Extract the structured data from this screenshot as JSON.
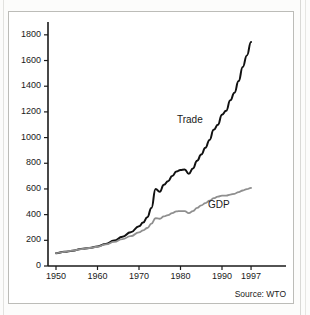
{
  "figure": {
    "clipped_caption_above": "",
    "source_note": "Source: WTO"
  },
  "chart_data": {
    "type": "line",
    "title": "",
    "subtitle": "",
    "xlabel": "",
    "ylabel": "",
    "xlim": [
      1950,
      1999
    ],
    "ylim": [
      0,
      1900
    ],
    "yticks": [
      0,
      200,
      400,
      600,
      800,
      1000,
      1200,
      1400,
      1600,
      1800
    ],
    "ytick_labels": [
      "0",
      "200",
      "400",
      "600",
      "800",
      "1000",
      "1200",
      "1400",
      "1600",
      "1800"
    ],
    "xticks": [
      1950,
      1960,
      1970,
      1980,
      1990,
      1997
    ],
    "xtick_labels": [
      "1950",
      "1960",
      "1970",
      "1980",
      "1990",
      "1997"
    ],
    "grid": false,
    "legend": "inline-annotation",
    "annotations": [
      {
        "text": "Trade",
        "x": 1983.0,
        "y": 1130
      },
      {
        "text": "GDP",
        "x": 1990.5,
        "y": 470
      }
    ],
    "series": [
      {
        "name": "Trade",
        "color": "#111111",
        "width": 2.0,
        "x": [
          1950,
          1952,
          1954,
          1956,
          1958,
          1960,
          1962,
          1964,
          1966,
          1968,
          1970,
          1971,
          1972,
          1973,
          1974,
          1975,
          1976,
          1977,
          1978,
          1979,
          1980,
          1981,
          1982,
          1983,
          1984,
          1985,
          1986,
          1987,
          1988,
          1989,
          1990,
          1991,
          1992,
          1993,
          1994,
          1995,
          1996,
          1997
        ],
        "y": [
          100,
          110,
          118,
          132,
          140,
          152,
          172,
          198,
          228,
          262,
          310,
          338,
          380,
          452,
          600,
          578,
          632,
          660,
          700,
          735,
          748,
          752,
          718,
          760,
          820,
          868,
          920,
          982,
          1060,
          1100,
          1178,
          1208,
          1290,
          1350,
          1440,
          1550,
          1640,
          1745
        ]
      },
      {
        "name": "GDP",
        "color": "#8f8f8f",
        "width": 1.8,
        "x": [
          1950,
          1952,
          1954,
          1956,
          1958,
          1960,
          1962,
          1964,
          1966,
          1968,
          1970,
          1971,
          1972,
          1973,
          1974,
          1975,
          1976,
          1977,
          1978,
          1979,
          1980,
          1981,
          1982,
          1983,
          1984,
          1985,
          1986,
          1987,
          1988,
          1989,
          1990,
          1991,
          1992,
          1993,
          1994,
          1995,
          1996,
          1997
        ],
        "y": [
          100,
          110,
          120,
          132,
          140,
          150,
          168,
          188,
          210,
          232,
          262,
          278,
          296,
          330,
          372,
          368,
          386,
          396,
          412,
          425,
          428,
          428,
          412,
          428,
          452,
          472,
          490,
          508,
          528,
          540,
          548,
          548,
          556,
          562,
          576,
          588,
          598,
          608
        ]
      }
    ]
  }
}
